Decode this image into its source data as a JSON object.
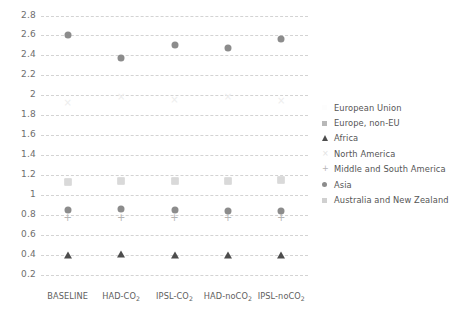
{
  "chart_data": {
    "type": "scatter",
    "title": "",
    "xlabel": "",
    "ylabel": "",
    "ylim": [
      0.2,
      2.8
    ],
    "ytick_step": 0.2,
    "grid": true,
    "legend_position": "right",
    "categories": [
      "BASELINE",
      "HAD-CO2",
      "IPSL-CO2",
      "HAD-noCO2",
      "IPSL-noCO2"
    ],
    "category_labels_html": [
      "BASELINE",
      "HAD-CO<sub>2</sub>",
      "IPSL-CO<sub>2</sub>",
      "HAD-noCO<sub>2</sub>",
      "IPSL-noCO<sub>2</sub>"
    ],
    "yticks": [
      "0.2",
      "0.4",
      "0.6",
      "0.8",
      "1",
      "1.2",
      "1.4",
      "1.6",
      "1.8",
      "2",
      "2.2",
      "2.4",
      "2.6",
      "2.8"
    ],
    "series": [
      {
        "name": "European Union",
        "marker": "square",
        "color": "#fbfbfb",
        "values": [
          1.13,
          1.14,
          1.14,
          1.14,
          1.15
        ]
      },
      {
        "name": "Europe, non-EU",
        "marker": "square",
        "color": "#c9c9c9",
        "values": [
          1.13,
          1.14,
          1.14,
          1.14,
          1.15
        ]
      },
      {
        "name": "Africa",
        "marker": "triangle",
        "color": "#4d4d4d",
        "values": [
          0.4,
          0.41,
          0.4,
          0.4,
          0.4
        ]
      },
      {
        "name": "North America",
        "marker": "x",
        "color": "#ededed",
        "values": [
          1.93,
          1.99,
          1.96,
          1.99,
          1.95
        ]
      },
      {
        "name": "Middle and South America",
        "marker": "plus",
        "color": "#b5b5b5",
        "values": [
          0.78,
          0.78,
          0.78,
          0.78,
          0.78
        ]
      },
      {
        "name": "Asia",
        "marker": "circle",
        "color": "#8c8c8c",
        "values": [
          0.85,
          0.86,
          0.85,
          0.84,
          0.84
        ]
      },
      {
        "name": "Asia (upper)",
        "marker": "circle",
        "color": "#8c8c8c",
        "hide_in_legend": true,
        "values": [
          2.6,
          2.37,
          2.5,
          2.47,
          2.56
        ]
      },
      {
        "name": "Australia and New Zealand",
        "marker": "square",
        "color": "#d9d9d9",
        "values": [
          1.13,
          1.14,
          1.14,
          1.14,
          1.15
        ]
      }
    ]
  },
  "legend": {
    "entries": [
      {
        "label": "European Union",
        "marker": "blank",
        "color": "#fdfdfd"
      },
      {
        "label": "Europe, non-EU",
        "marker": "square",
        "color": "#b8b8b8"
      },
      {
        "label": "Africa",
        "marker": "triangle",
        "color": "#4d4d4d"
      },
      {
        "label": "North America",
        "marker": "x",
        "color": "#e2e2e2"
      },
      {
        "label": "Middle and South America",
        "marker": "plus",
        "color": "#b5b5b5"
      },
      {
        "label": "Asia",
        "marker": "circle",
        "color": "#8c8c8c"
      },
      {
        "label": "Australia and New Zealand",
        "marker": "square",
        "color": "#d0d0d0"
      }
    ]
  }
}
